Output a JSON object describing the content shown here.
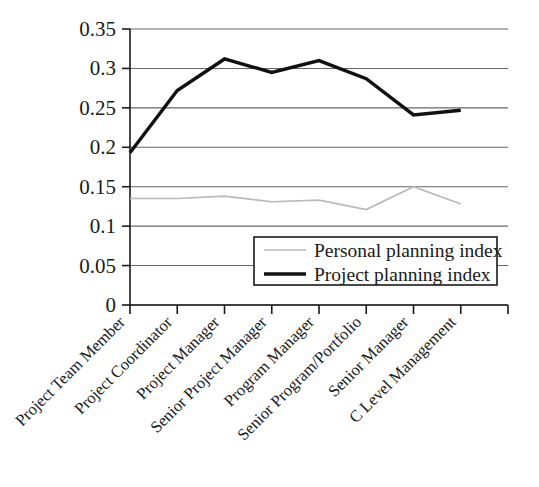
{
  "chart_data": {
    "type": "line",
    "title": "",
    "xlabel": "",
    "ylabel": "",
    "categories": [
      "Project Team Member",
      "Project Coordinator",
      "Project Manager",
      "Senior Project Manager",
      "Program Manager",
      "Senior Program/Portfolio",
      "Senior Manager",
      "C Level Management"
    ],
    "series": [
      {
        "name": "Personal planning index",
        "color": "#b9b9b9",
        "line_width": 1.6,
        "values": [
          0.135,
          0.135,
          0.138,
          0.131,
          0.133,
          0.121,
          0.15,
          0.128
        ]
      },
      {
        "name": "Project planning index",
        "color": "#111111",
        "line_width": 3.4,
        "values": [
          0.193,
          0.272,
          0.312,
          0.295,
          0.31,
          0.287,
          0.241,
          0.247
        ]
      }
    ],
    "ylim": [
      0,
      0.35
    ],
    "yticks": [
      0,
      0.05,
      0.1,
      0.15,
      0.2,
      0.25,
      0.3,
      0.35
    ],
    "ytick_labels": [
      "0",
      "0.05",
      "0.1",
      "0.15",
      "0.2",
      "0.25",
      "0.3",
      "0.35"
    ],
    "grid": true,
    "grid_axis": "y",
    "grid_color": "#666666",
    "legend_position": "inside-lower-right",
    "xtick_label_rotation": -45
  },
  "legend": {
    "entries": [
      {
        "label": "Personal planning index",
        "swatch": "personal-planning-line-swatch"
      },
      {
        "label": "Project planning index",
        "swatch": "project-planning-line-swatch"
      }
    ]
  },
  "axes": {
    "y_axis_name": "y-axis",
    "x_axis_name": "x-axis"
  }
}
